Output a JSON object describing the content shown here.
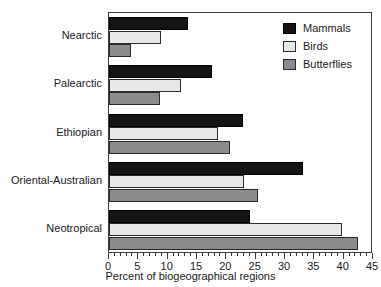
{
  "chart_data": {
    "type": "bar",
    "orientation": "horizontal",
    "title": "",
    "xlabel": "Percent of biogeographical regions",
    "ylabel": "",
    "xlim": [
      0,
      45
    ],
    "xticks": [
      0,
      5,
      10,
      15,
      20,
      25,
      30,
      35,
      40,
      45
    ],
    "xtick_labels": [
      "0",
      "5",
      "10",
      "15",
      "20",
      "25",
      "30",
      "35",
      "40",
      "45"
    ],
    "minor_tick_step": 1,
    "grid": false,
    "legend_position": "top-right",
    "categories": [
      "Nearctic",
      "Palearctic",
      "Ethiopian",
      "Oriental-Australian",
      "Neotropical"
    ],
    "series": [
      {
        "name": "Mammals",
        "color": "#141414",
        "values": [
          13.4,
          17.6,
          22.8,
          33.1,
          24.0
        ]
      },
      {
        "name": "Birds",
        "color": "#e7e7e7",
        "values": [
          8.8,
          12.3,
          18.6,
          23.0,
          39.7
        ]
      },
      {
        "name": "Butterflies",
        "color": "#8b8b8b",
        "values": [
          3.7,
          8.7,
          20.6,
          25.4,
          42.5
        ]
      }
    ]
  },
  "legend": {
    "items": [
      {
        "label": "Mammals",
        "swatch": "mammals"
      },
      {
        "label": "Birds",
        "swatch": "birds"
      },
      {
        "label": "Butterflies",
        "swatch": "butterflies"
      }
    ]
  }
}
